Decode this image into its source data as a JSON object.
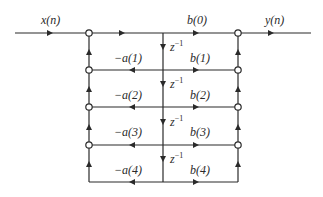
{
  "diagram": {
    "type": "signal-flow-graph",
    "input_label": "x(n)",
    "output_label": "y(n)",
    "delay_label": "z",
    "delay_exponent": "−1",
    "feedback_coeffs": [
      "−a(1)",
      "−a(2)",
      "−a(3)",
      "−a(4)"
    ],
    "feedforward_coeffs": [
      "b(0)",
      "b(1)",
      "b(2)",
      "b(3)",
      "b(4)"
    ],
    "line_color": "#2a2a2a"
  }
}
